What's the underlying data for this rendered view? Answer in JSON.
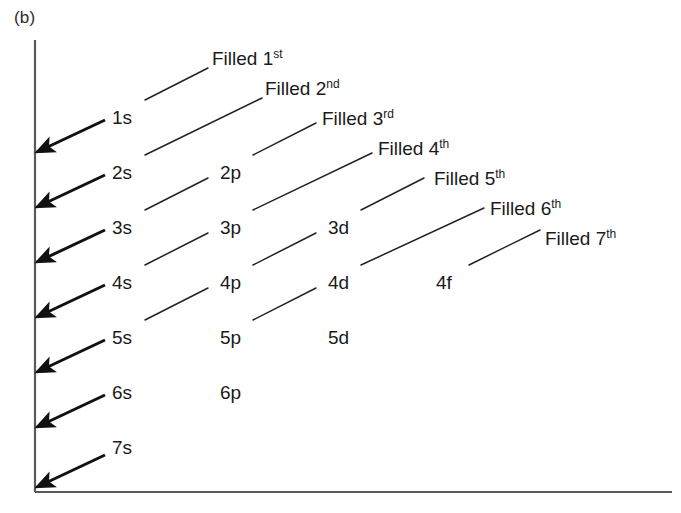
{
  "figure": {
    "panel_label": "(b)",
    "axis_color": "#5a5a5a",
    "line_color": "#222222",
    "arrow_color": "#111111",
    "text_color": "#1a1a1a",
    "background": "#ffffff",
    "axis": {
      "origin_x": 35,
      "origin_y": 492,
      "top_y": 40,
      "right_x": 672
    }
  },
  "chart_data": {
    "type": "diagram",
    "grid": {
      "col_x": [
        112,
        220,
        328,
        436
      ],
      "row_y": [
        108,
        163,
        218,
        273,
        328,
        383,
        438
      ],
      "row_labels": [
        "1",
        "2",
        "3",
        "4",
        "5",
        "6",
        "7"
      ],
      "col_labels": [
        "s",
        "p",
        "d",
        "f"
      ]
    },
    "orbitals": [
      {
        "label": "1s",
        "n": 1,
        "sub": "s",
        "col": 0,
        "row": 0,
        "x": 112,
        "y": 108
      },
      {
        "label": "2s",
        "n": 2,
        "sub": "s",
        "col": 0,
        "row": 1,
        "x": 112,
        "y": 163
      },
      {
        "label": "2p",
        "n": 2,
        "sub": "p",
        "col": 1,
        "row": 1,
        "x": 220,
        "y": 163
      },
      {
        "label": "3s",
        "n": 3,
        "sub": "s",
        "col": 0,
        "row": 2,
        "x": 112,
        "y": 218
      },
      {
        "label": "3p",
        "n": 3,
        "sub": "p",
        "col": 1,
        "row": 2,
        "x": 220,
        "y": 218
      },
      {
        "label": "3d",
        "n": 3,
        "sub": "d",
        "col": 2,
        "row": 2,
        "x": 328,
        "y": 218
      },
      {
        "label": "4s",
        "n": 4,
        "sub": "s",
        "col": 0,
        "row": 3,
        "x": 112,
        "y": 273
      },
      {
        "label": "4p",
        "n": 4,
        "sub": "p",
        "col": 1,
        "row": 3,
        "x": 220,
        "y": 273
      },
      {
        "label": "4d",
        "n": 4,
        "sub": "d",
        "col": 2,
        "row": 3,
        "x": 328,
        "y": 273
      },
      {
        "label": "4f",
        "n": 4,
        "sub": "f",
        "col": 3,
        "row": 3,
        "x": 436,
        "y": 273
      },
      {
        "label": "5s",
        "n": 5,
        "sub": "s",
        "col": 0,
        "row": 4,
        "x": 112,
        "y": 328
      },
      {
        "label": "5p",
        "n": 5,
        "sub": "p",
        "col": 1,
        "row": 4,
        "x": 220,
        "y": 328
      },
      {
        "label": "5d",
        "n": 5,
        "sub": "d",
        "col": 2,
        "row": 4,
        "x": 328,
        "y": 328
      },
      {
        "label": "6s",
        "n": 6,
        "sub": "s",
        "col": 0,
        "row": 5,
        "x": 112,
        "y": 383
      },
      {
        "label": "6p",
        "n": 6,
        "sub": "p",
        "col": 1,
        "row": 5,
        "x": 220,
        "y": 383
      },
      {
        "label": "7s",
        "n": 7,
        "sub": "s",
        "col": 0,
        "row": 6,
        "x": 112,
        "y": 438
      }
    ],
    "filled_labels": [
      {
        "text": "Filled 1",
        "ordinal": "st",
        "order": 1,
        "x": 212,
        "y": 48
      },
      {
        "text": "Filled 2",
        "ordinal": "nd",
        "order": 2,
        "x": 265,
        "y": 78
      },
      {
        "text": "Filled 3",
        "ordinal": "rd",
        "order": 3,
        "x": 322,
        "y": 108
      },
      {
        "text": "Filled 4",
        "ordinal": "th",
        "order": 4,
        "x": 378,
        "y": 138
      },
      {
        "text": "Filled 5",
        "ordinal": "th",
        "order": 5,
        "x": 434,
        "y": 168
      },
      {
        "text": "Filled 6",
        "ordinal": "th",
        "order": 6,
        "x": 490,
        "y": 198
      },
      {
        "text": "Filled 7",
        "ordinal": "th",
        "order": 7,
        "x": 545,
        "y": 228
      }
    ],
    "diagonals": [
      {
        "order": 1,
        "segments": [
          [
            145,
            100,
            208,
            68
          ]
        ]
      },
      {
        "order": 2,
        "segments": [
          [
            145,
            155,
            262,
            98
          ]
        ]
      },
      {
        "order": 3,
        "segments": [
          [
            253,
            155,
            316,
            123
          ]
        ],
        "extra": [
          [
            145,
            210,
            208,
            178
          ]
        ]
      },
      {
        "order": 4,
        "segments": [
          [
            253,
            210,
            372,
            153
          ]
        ],
        "extra": [
          [
            145,
            265,
            208,
            233
          ]
        ]
      },
      {
        "order": 5,
        "segments": [
          [
            361,
            210,
            424,
            178
          ]
        ],
        "extra": [
          [
            253,
            265,
            316,
            233
          ]
        ]
      },
      {
        "order": 6,
        "segments": [
          [
            361,
            265,
            484,
            208
          ]
        ],
        "extra": [
          [
            145,
            320,
            208,
            288
          ]
        ]
      },
      {
        "order": 7,
        "segments": [
          [
            469,
            265,
            540,
            230
          ]
        ],
        "extra": [
          [
            253,
            320,
            316,
            288
          ]
        ]
      }
    ],
    "arrows": [
      {
        "index": 1,
        "from_x": 105,
        "from_y": 120,
        "to_x": 37,
        "to_y": 152
      },
      {
        "index": 2,
        "from_x": 105,
        "from_y": 175,
        "to_x": 37,
        "to_y": 207
      },
      {
        "index": 3,
        "from_x": 105,
        "from_y": 230,
        "to_x": 37,
        "to_y": 262
      },
      {
        "index": 4,
        "from_x": 105,
        "from_y": 285,
        "to_x": 37,
        "to_y": 317
      },
      {
        "index": 5,
        "from_x": 105,
        "from_y": 340,
        "to_x": 37,
        "to_y": 372
      },
      {
        "index": 6,
        "from_x": 105,
        "from_y": 395,
        "to_x": 37,
        "to_y": 427
      },
      {
        "index": 7,
        "from_x": 105,
        "from_y": 455,
        "to_x": 37,
        "to_y": 487
      }
    ]
  }
}
